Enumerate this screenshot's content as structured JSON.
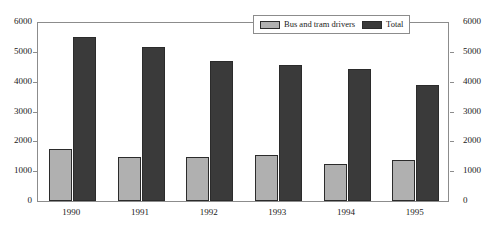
{
  "chart_data": {
    "type": "bar",
    "title": "",
    "xlabel": "",
    "ylabel": "",
    "ylim": [
      0,
      6000
    ],
    "y2lim": [
      0,
      6000
    ],
    "grid": false,
    "legend_position": "top-right",
    "categories": [
      "1990",
      "1991",
      "1992",
      "1993",
      "1994",
      "1995"
    ],
    "ytick_labels": [
      "6000",
      "5000",
      "4000",
      "3000",
      "2000",
      "1000",
      "0"
    ],
    "ytick_values": [
      6000,
      5000,
      4000,
      3000,
      2000,
      1000,
      0
    ],
    "y2tick_labels": [
      "6000",
      "5000",
      "4000",
      "3000",
      "2000",
      "1000",
      "0"
    ],
    "y2tick_values": [
      6000,
      5000,
      4000,
      3000,
      2000,
      1000,
      0
    ],
    "series": [
      {
        "name": "Bus and tram drivers",
        "color": "#b0b0b0",
        "values": [
          1740,
          1460,
          1460,
          1540,
          1240,
          1360
        ]
      },
      {
        "name": "Total",
        "color": "#3a3a3a",
        "values": [
          5500,
          5150,
          4700,
          4570,
          4430,
          3880
        ]
      }
    ]
  },
  "legend": {
    "items": [
      {
        "label": "Bus and tram drivers",
        "color": "#b0b0b0"
      },
      {
        "label": "Total",
        "color": "#3a3a3a"
      }
    ]
  }
}
